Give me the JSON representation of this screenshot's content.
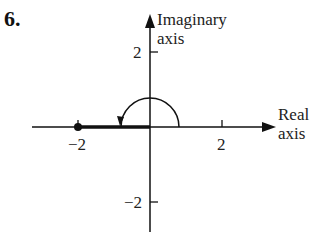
{
  "problem_number": "6.",
  "axes": {
    "imaginary_label_line1": "Imaginary",
    "imaginary_label_line2": "axis",
    "real_label_line1": "Real",
    "real_label_line2": "axis"
  },
  "ticks": {
    "x_neg": "−2",
    "x_pos": "2",
    "y_pos": "2",
    "y_neg": "−2"
  },
  "diagram": {
    "dot_at": -2,
    "arc_radius": 0.8,
    "line_color": "#111111"
  }
}
